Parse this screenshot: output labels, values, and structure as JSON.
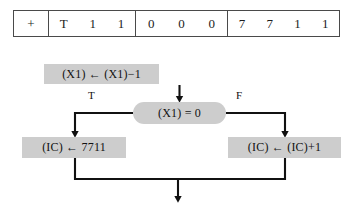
{
  "diagram": {
    "colors": {
      "node_fill": "#cdcdcd",
      "line": "#111111",
      "table_border": "#4a4a4a",
      "background": "#ffffff",
      "text": "#111111"
    }
  },
  "word_table": {
    "groups": [
      {
        "name": "sign",
        "cells": [
          "+"
        ]
      },
      {
        "name": "opcode",
        "cells": [
          "T",
          "1",
          "1"
        ]
      },
      {
        "name": "field-2",
        "cells": [
          "0",
          "0",
          "0"
        ]
      },
      {
        "name": "address",
        "cells": [
          "7",
          "7",
          "1",
          "1"
        ]
      }
    ]
  },
  "flowchart": {
    "nodes": {
      "decrement": {
        "label": "(X1)  ←  (X1)−1",
        "shape": "process"
      },
      "decision": {
        "label": "(X1)  =  0",
        "shape": "decision"
      },
      "set_ic": {
        "label": "(IC)  ←  7711",
        "shape": "process"
      },
      "increment_ic": {
        "label": "(IC)  ←  (IC)+1",
        "shape": "process"
      }
    },
    "branch_labels": {
      "true": "T",
      "false": "F"
    }
  }
}
